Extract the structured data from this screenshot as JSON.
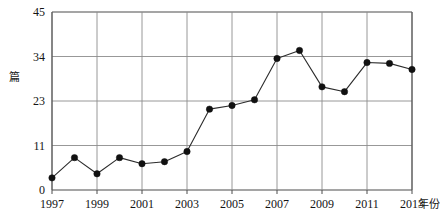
{
  "chart_data": {
    "type": "line",
    "title": "",
    "subtitle": "",
    "xlabel": "年份",
    "ylabel": "篇",
    "x": [
      1997,
      1998,
      1999,
      2000,
      2001,
      2002,
      2003,
      2004,
      2005,
      2006,
      2007,
      2008,
      2009,
      2010,
      2011,
      2012,
      2013
    ],
    "values": [
      3,
      8,
      4,
      8,
      6.5,
      7,
      9.5,
      20.8,
      21.8,
      23.3,
      33.5,
      35.5,
      26.5,
      25.3,
      32.5,
      32.3,
      30.8
    ],
    "series": [
      {
        "name": "",
        "values": [
          3,
          8,
          4,
          8,
          6.5,
          7,
          9.5,
          20.8,
          21.8,
          23.3,
          33.5,
          35.5,
          26.5,
          25.3,
          32.5,
          32.3,
          30.8
        ]
      }
    ],
    "xlim": [
      1996.5,
      2013.5
    ],
    "ylim": [
      0,
      45
    ],
    "y_ticks": [
      "0",
      "11",
      "23",
      "34",
      "45"
    ],
    "y_tick_values": [
      0,
      11,
      23,
      34,
      45
    ],
    "x_ticks": [
      "1997",
      "1999",
      "2001",
      "2003",
      "2005",
      "2007",
      "2009",
      "2011",
      "2013"
    ],
    "x_tick_values": [
      1997,
      1999,
      2001,
      2003,
      2005,
      2007,
      2009,
      2011,
      2013
    ],
    "grid": true,
    "grid_x": true,
    "grid_y": true,
    "legend": false,
    "legend_position": "none",
    "marker": "filled-circle",
    "line_color": "#2b2b2b",
    "marker_color": "#111111",
    "grid_color": "#8c8c8c",
    "axis_color": "#4d4d4d",
    "background": "#ffffff",
    "annotations": []
  }
}
